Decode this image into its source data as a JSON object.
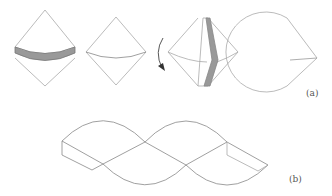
{
  "figure": {
    "panel_a": {
      "label": "(a)",
      "steps": [
        {
          "name": "cone-with-shaded-band",
          "description": "double cone with gray band around equator"
        },
        {
          "name": "double-cone",
          "description": "double cone outline"
        },
        {
          "name": "rotation-arrow",
          "description": "curved arrow pointing down"
        },
        {
          "name": "cone-with-shaded-wedge",
          "description": "double cone with vertical gray wedge slice"
        },
        {
          "name": "circular-sector",
          "description": "unrolled sector"
        }
      ]
    },
    "panel_b": {
      "label": "(b)",
      "description": "unrolled chain of cone sectors with folded boxes at ends"
    },
    "colors": {
      "line": "#999999",
      "dark_line": "#777777",
      "fill": "#999999"
    }
  }
}
